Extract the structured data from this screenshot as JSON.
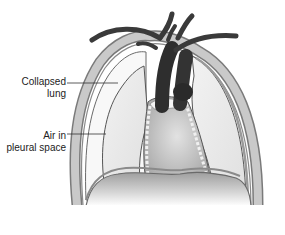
{
  "diagram": {
    "labels": [
      {
        "id": "collapsed-lung",
        "line1": "Collapsed",
        "line2": "lung"
      },
      {
        "id": "air-in-pleural-space",
        "line1": "Air in",
        "line2": "pleural space"
      }
    ],
    "structures": [
      "rib-cage",
      "collapsed-right-lung",
      "normal-left-lung",
      "great-vessels",
      "heart",
      "mediastinum",
      "diaphragm"
    ],
    "colors": {
      "background": "#ffffff",
      "vessels": "#3a3a3a",
      "lung_fill": "#ececec",
      "pleural_air": "#f7f7f7",
      "rib_wall": "#b5b5b5",
      "heart": "#bdbdbd",
      "diaphragm_top": "#a9a9a9",
      "outline": "#555555"
    }
  }
}
